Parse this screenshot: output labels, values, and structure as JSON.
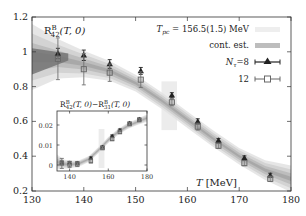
{
  "chart_data": [
    {
      "type": "scatter",
      "title": "R^B_42(T,0)",
      "title_parts": {
        "base": "R",
        "sup": "B",
        "sub": "42",
        "arg": "(T, 0)"
      },
      "xlabel": "T [MeV]",
      "xlabel_parts": {
        "var": "T",
        "unit": "[MeV]"
      },
      "ylabel": "",
      "xlim": [
        130,
        180
      ],
      "ylim": [
        0.2,
        1.2
      ],
      "xticks": [
        130,
        140,
        150,
        160,
        170,
        180
      ],
      "yticks": [
        0.2,
        0.4,
        0.6,
        0.8,
        1.0,
        1.2
      ],
      "ytick_labels": [
        "0.2",
        "0.4",
        "0.6",
        "0.8",
        "1",
        "1.2"
      ],
      "xtick_labels": [
        "130",
        "140",
        "150",
        "160",
        "170",
        "180"
      ],
      "grid": false,
      "legend_position": "top-right",
      "legend": [
        {
          "label": "T_pc = 156.5(1.5) MeV",
          "label_parts": {
            "var": "T",
            "sub": "pc",
            "rest": " = 156.5(1.5) MeV"
          },
          "kind": "band",
          "color": "#eeeeee"
        },
        {
          "label": "cont. est.",
          "kind": "band",
          "color": "#bdbdbd"
        },
        {
          "label": "N_τ=8",
          "label_parts": {
            "var": "N",
            "sub": "τ",
            "rest": "=8"
          },
          "kind": "triangle",
          "color": "#222222"
        },
        {
          "label": "12",
          "kind": "square",
          "color": "#777777"
        }
      ],
      "tpc_band": {
        "center": 156.5,
        "error": 1.5
      },
      "series": [
        {
          "name": "N_tau=8",
          "marker": "triangle",
          "x": [
            135,
            140,
            145,
            151,
            157,
            162,
            166,
            171,
            176
          ],
          "y": [
            0.99,
            0.98,
            0.93,
            0.89,
            0.75,
            0.6,
            0.49,
            0.39,
            0.29
          ],
          "yerr": [
            0.03,
            0.03,
            0.025,
            0.02,
            0.015,
            0.015,
            0.012,
            0.012,
            0.012
          ]
        },
        {
          "name": "N_tau=12",
          "marker": "square",
          "x": [
            135,
            140,
            145,
            151,
            157,
            162,
            166,
            171,
            176
          ],
          "y": [
            0.96,
            0.9,
            0.88,
            0.84,
            0.71,
            0.57,
            0.46,
            0.36,
            0.27
          ],
          "yerr": [
            0.12,
            0.09,
            0.05,
            0.045,
            0.02,
            0.02,
            0.015,
            0.015,
            0.015
          ]
        }
      ],
      "continuum_band": {
        "x": [
          130,
          135,
          140,
          145,
          150,
          155,
          160,
          165,
          170,
          175,
          180
        ],
        "y": [
          0.97,
          0.96,
          0.93,
          0.89,
          0.82,
          0.72,
          0.61,
          0.5,
          0.4,
          0.32,
          0.27
        ],
        "err": [
          0.1,
          0.06,
          0.04,
          0.03,
          0.025,
          0.025,
          0.025,
          0.025,
          0.025,
          0.03,
          0.04
        ]
      }
    },
    {
      "type": "scatter",
      "title": "R^B_42(T,0) - R^B_31(T,0)",
      "title_parts": {
        "a": "R",
        "a_sup": "B",
        "a_sub": "42",
        "arg": "(T, 0)",
        "minus": "−",
        "b": "R",
        "b_sup": "B",
        "b_sub": "31"
      },
      "xlim": [
        133.5,
        180
      ],
      "ylim": [
        -0.003,
        0.027
      ],
      "xticks": [
        140,
        160,
        180
      ],
      "xtick_labels": [
        "140",
        "160",
        "180"
      ],
      "yticks": [
        0,
        0.01,
        0.02
      ],
      "ytick_labels": [
        "0",
        "0.01",
        "0.02"
      ],
      "grid": false,
      "series": [
        {
          "name": "N_tau=8",
          "marker": "triangle",
          "x": [
            136,
            140,
            144,
            151,
            157,
            162,
            166,
            171,
            176
          ],
          "y": [
            0.0012,
            0.0012,
            0.001,
            0.0035,
            0.009,
            0.0145,
            0.0175,
            0.021,
            0.023
          ],
          "yerr": [
            0.0008,
            0.0006,
            0.0006,
            0.0005,
            0.0005,
            0.0005,
            0.0005,
            0.0005,
            0.0005
          ]
        },
        {
          "name": "N_tau=12",
          "marker": "square",
          "x": [
            136,
            140,
            144,
            151,
            157,
            162,
            166,
            171,
            176
          ],
          "y": [
            0.0008,
            0.0003,
            0.0004,
            0.002,
            0.0085,
            0.013,
            0.0165,
            0.0205,
            0.0225
          ],
          "yerr": [
            0.0025,
            0.0015,
            0.0012,
            0.001,
            0.0008,
            0.0008,
            0.0008,
            0.0008,
            0.0008
          ]
        }
      ],
      "continuum_band": {
        "x": [
          133.5,
          137,
          140,
          145,
          150,
          155,
          160,
          165,
          170,
          175,
          180
        ],
        "y": [
          0.0015,
          0.0005,
          0.0002,
          0.0008,
          0.003,
          0.0075,
          0.0125,
          0.0165,
          0.0195,
          0.0215,
          0.0235
        ],
        "err": [
          0.002,
          0.0012,
          0.001,
          0.0008,
          0.0008,
          0.0008,
          0.0008,
          0.0008,
          0.0008,
          0.0008,
          0.001
        ]
      }
    }
  ]
}
